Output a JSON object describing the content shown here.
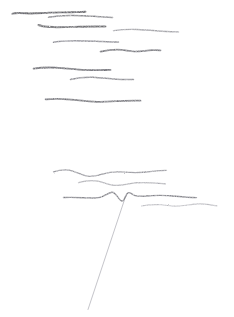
{
  "artwork": {
    "title": "Untitled pencil sketch",
    "medium": "graphite pencil on paper",
    "background_color": "#ffffff",
    "width": 234,
    "height": 317
  },
  "palette": {
    "paper": "#ffffff",
    "stroke_dark": "#5a5a5e",
    "stroke_mid": "#6f6f74",
    "stroke_light": "#8e8e95",
    "stroke_faint": "#a9a9b0"
  },
  "groups": [
    {
      "name": "upper-stroke-cluster",
      "label": "Upper group of horizontal pencil strokes",
      "stroke_count": 9
    },
    {
      "name": "lower-stroke-cluster",
      "label": "Lower group of horizontal pencil strokes",
      "stroke_count": 4
    },
    {
      "name": "diagonal-line-group",
      "label": "Single thin diagonal line",
      "stroke_count": 1
    }
  ],
  "strokes": [
    {
      "id": "stroke-1",
      "group": "upper-stroke-cluster",
      "color": "#4e4e52",
      "width": 1.9,
      "opacity": 0.92,
      "d": "M12.5 13.6 C16 12.6 21 12.9 26 13.3 C33 13.8 41 13.0 49 12.6 C57 12.2 65 12.5 72 12.3 C78 12.1 82 12.0 85.5 11.8"
    },
    {
      "id": "stroke-2",
      "group": "upper-stroke-cluster",
      "color": "#6a6a70",
      "width": 1.5,
      "opacity": 0.85,
      "d": "M48.5 17.2 C55 16.2 62 15.7 70 15.6 C79 15.5 88 16.0 96 16.4 C103 16.8 108 17.1 112.5 17.4"
    },
    {
      "id": "stroke-3",
      "group": "upper-stroke-cluster",
      "color": "#4f4f54",
      "width": 2.0,
      "opacity": 0.9,
      "d": "M38.5 25.0 C42 26.4 47 27.0 53 27.1 C62 27.3 71 26.9 80 26.7 C89 26.5 97 26.5 105.5 26.6"
    },
    {
      "id": "stroke-4",
      "group": "upper-stroke-cluster",
      "color": "#82828a",
      "width": 1.4,
      "opacity": 0.8,
      "d": "M113.5 30.6 C121 29.6 129 29.2 137 29.5 C146 29.8 154 30.6 162 31.2 C169 31.6 174 31.8 178.5 31.9"
    },
    {
      "id": "stroke-5",
      "group": "upper-stroke-cluster",
      "color": "#70707a",
      "width": 1.5,
      "opacity": 0.84,
      "d": "M53.5 42.3 C60 41.3 68 40.8 76 40.8 C85 40.8 94 41.3 102 41.6 C110 41.9 115 42.0 118.5 42.0"
    },
    {
      "id": "stroke-6",
      "group": "upper-stroke-cluster",
      "color": "#5d5d64",
      "width": 1.7,
      "opacity": 0.86,
      "d": "M100.5 51.6 C107 50.2 114 49.4 121 49.8 C126 50.1 129 51.4 134 51.5 C140 51.6 146 50.5 152 50.2 C156 50.0 158.5 50.1 160.5 50.3"
    },
    {
      "id": "stroke-7",
      "group": "upper-stroke-cluster",
      "color": "#53535a",
      "width": 1.8,
      "opacity": 0.9,
      "d": "M33.5 68.6 C40 67.6 48 67.3 56 67.7 C64 68.1 71 69.1 79 69.6 C88 70.2 97 70.1 105 70.0 C108 69.9 109.5 69.9 110.5 69.9"
    },
    {
      "id": "stroke-8",
      "group": "upper-stroke-cluster",
      "color": "#6c6c74",
      "width": 1.5,
      "opacity": 0.82,
      "d": "M70.5 79.6 C77 77.9 85 77.0 93 77.3 C101 77.6 108 78.7 116 79.2 C123 79.6 129 79.6 133.5 79.5"
    },
    {
      "id": "stroke-9",
      "group": "upper-stroke-cluster",
      "color": "#5b5b62",
      "width": 1.8,
      "opacity": 0.88,
      "d": "M45.5 99.3 C53 98.7 62 98.8 71 99.6 C80 100.4 88 101.6 97 101.8 C106 102.0 115 101.2 124 100.8 C132 100.5 137.5 100.5 140.5 100.6"
    },
    {
      "id": "stroke-10",
      "group": "lower-stroke-cluster",
      "color": "#74747c",
      "width": 1.3,
      "opacity": 0.8,
      "d": "M53.5 171.9 C60 169.8 67 169.3 73 171.2 C79 173.1 83 176.0 89 176.4 C96 176.9 103 173.4 110 172.3 C117 171.2 123 172.0 130 172.4 C138 172.9 145 172.3 152 171.4 C158 170.7 163 170.3 166.5 170.3"
    },
    {
      "id": "stroke-11",
      "group": "lower-stroke-cluster",
      "color": "#8a8a92",
      "width": 1.2,
      "opacity": 0.74,
      "d": "M78.5 182.6 C85 180.6 92 180.0 98 181.2 C104 182.4 108 184.8 114 185.3 C121 185.9 128 183.6 135 182.9 C143 182.1 150 182.6 157 183.2 C161 183.5 163.5 183.7 165.5 183.8"
    },
    {
      "id": "stroke-12a",
      "group": "lower-stroke-cluster",
      "color": "#62626a",
      "width": 1.4,
      "opacity": 0.85,
      "d": "M63.5 197.5 C70 197.2 77 197.4 83 197.7 C90 198.0 95 198.6 100 197.4 C105 196.2 108 192.5 112 192.2 C115 192.0 117 196.3 119 198.6 C121 200.9 122 201.9 123.5 200.3 C125 198.7 126 194.0 128 192.8 C130 191.7 132 194.6 135 195.6 C140 197.2 146 196.0 152 195.6 C160 195.1 168 195.4 176 196.2 C184 197.0 191 197.5 196.5 197.6"
    },
    {
      "id": "stroke-13",
      "group": "lower-stroke-cluster",
      "color": "#9a9aa2",
      "width": 1.1,
      "opacity": 0.7,
      "d": "M141.5 206.0 C148 204.8 155 204.4 161 204.8 C167 205.2 172 206.3 178 206.1 C185 205.8 192 203.9 199 203.9 C206 203.9 212 205.2 217 205.9"
    },
    {
      "id": "diagonal-line",
      "group": "diagonal-line-group",
      "color": "#a3a3ab",
      "width": 0.85,
      "opacity": 0.75,
      "d": "M124.2 200.6 L88.0 309.5"
    }
  ]
}
